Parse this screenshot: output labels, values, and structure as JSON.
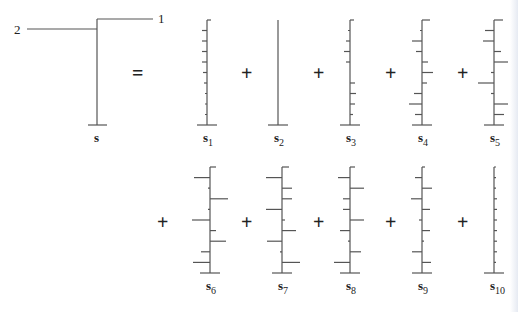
{
  "diagram": {
    "tree": {
      "label": "s",
      "branch_labels": [
        "1",
        "2"
      ],
      "stem_x": 97,
      "top_y": 19,
      "base_y": 125,
      "branch1": {
        "y": 19,
        "x_end": 153,
        "label_x": 158
      },
      "branch2": {
        "y": 29,
        "x_start": 27,
        "label_x": 14
      },
      "equals": "="
    },
    "operators": {
      "plus": "+"
    },
    "row1": {
      "top_y": 20,
      "base_y": 125,
      "label_y": 142,
      "plus_x": [
        247,
        319,
        391,
        463
      ],
      "plus_y": 80,
      "equals_x": 138,
      "equals_y": 80
    },
    "row2": {
      "top_y": 167,
      "base_y": 273,
      "label_y": 290,
      "plus_x": [
        163,
        247,
        319,
        391,
        463
      ],
      "plus_y": 229
    },
    "stems": [
      {
        "name": "s",
        "sub": "1",
        "x": 207,
        "row": 1,
        "ticks": [
          [
            -1,
            0,
            "R4"
          ],
          [
            -1,
            1,
            "L5"
          ],
          [
            -1,
            2,
            "L5"
          ],
          [
            -1,
            3,
            "L5"
          ],
          [
            -1,
            4,
            "L5"
          ],
          [
            -1,
            5,
            "L4"
          ],
          [
            -1,
            6,
            "L3"
          ],
          [
            -1,
            7,
            "L2"
          ],
          [
            -1,
            8,
            "L2"
          ],
          [
            -1,
            9,
            "L2"
          ]
        ]
      },
      {
        "name": "s",
        "sub": "2",
        "x": 278,
        "row": 1,
        "ticks": []
      },
      {
        "name": "s",
        "sub": "3",
        "x": 350,
        "row": 1,
        "ticks": [
          [
            0,
            "R4"
          ],
          [
            1,
            "L2"
          ],
          [
            2,
            "L4"
          ],
          [
            3,
            "L6"
          ],
          [
            4,
            "L4"
          ],
          [
            6,
            "R5"
          ],
          [
            7,
            "R6"
          ],
          [
            8,
            "R5"
          ],
          [
            9,
            "R3"
          ]
        ]
      },
      {
        "name": "s",
        "sub": "4",
        "x": 422,
        "row": 1,
        "ticks": [
          [
            0,
            "R8"
          ],
          [
            1,
            "L2"
          ],
          [
            2,
            "L10"
          ],
          [
            3,
            "L6"
          ],
          [
            4,
            "R6"
          ],
          [
            5,
            "R11"
          ],
          [
            6,
            "R5"
          ],
          [
            7,
            "L8"
          ],
          [
            8,
            "L13"
          ],
          [
            9,
            "L7"
          ]
        ]
      },
      {
        "name": "s",
        "sub": "5",
        "x": 494,
        "row": 1,
        "ticks": [
          [
            0,
            "R9"
          ],
          [
            1,
            "L9"
          ],
          [
            2,
            "L11"
          ],
          [
            3,
            "R7"
          ],
          [
            4,
            "R14"
          ],
          [
            5,
            "L3"
          ],
          [
            6,
            "L16"
          ],
          [
            7,
            "L3"
          ],
          [
            8,
            "R14"
          ],
          [
            9,
            "R10"
          ]
        ]
      },
      {
        "name": "s",
        "sub": "6",
        "x": 210,
        "row": 2,
        "ticks": [
          [
            0,
            "R6"
          ],
          [
            1,
            "L16"
          ],
          [
            2,
            "L2"
          ],
          [
            3,
            "R18"
          ],
          [
            4,
            "L2"
          ],
          [
            5,
            "L18"
          ],
          [
            6,
            "R6"
          ],
          [
            7,
            "R16"
          ],
          [
            8,
            "L9"
          ],
          [
            9,
            "L17"
          ]
        ]
      },
      {
        "name": "s",
        "sub": "7",
        "x": 282,
        "row": 2,
        "ticks": [
          [
            0,
            "R7"
          ],
          [
            1,
            "L16"
          ],
          [
            2,
            "R10"
          ],
          [
            3,
            "R10"
          ],
          [
            4,
            "L16"
          ],
          [
            5,
            "R3"
          ],
          [
            6,
            "R14"
          ],
          [
            7,
            "L15"
          ],
          [
            8,
            "L2"
          ],
          [
            9,
            "R18"
          ]
        ]
      },
      {
        "name": "s",
        "sub": "8",
        "x": 350,
        "row": 2,
        "ticks": [
          [
            0,
            "R5"
          ],
          [
            1,
            "L12"
          ],
          [
            2,
            "R14"
          ],
          [
            3,
            "L7"
          ],
          [
            4,
            "L7"
          ],
          [
            5,
            "R14"
          ],
          [
            6,
            "L10"
          ],
          [
            7,
            "L2"
          ],
          [
            8,
            "R11"
          ],
          [
            9,
            "L16"
          ]
        ]
      },
      {
        "name": "s",
        "sub": "9",
        "x": 422,
        "row": 2,
        "ticks": [
          [
            0,
            "R3"
          ],
          [
            1,
            "L7"
          ],
          [
            2,
            "R10"
          ],
          [
            3,
            "L11"
          ],
          [
            4,
            "R8"
          ],
          [
            5,
            "L3"
          ],
          [
            6,
            "R8"
          ],
          [
            7,
            "R2"
          ],
          [
            8,
            "L10"
          ],
          [
            9,
            "R9"
          ]
        ]
      },
      {
        "name": "s",
        "sub": "10",
        "x": 494,
        "row": 2,
        "ticks": [
          [
            0,
            "R2"
          ],
          [
            1,
            "R2"
          ],
          [
            2,
            "R2"
          ],
          [
            3,
            "R3"
          ],
          [
            4,
            "R3"
          ],
          [
            5,
            "R3"
          ],
          [
            6,
            "R3"
          ],
          [
            7,
            "R3"
          ],
          [
            8,
            "R3"
          ],
          [
            9,
            "R2"
          ]
        ]
      }
    ]
  }
}
